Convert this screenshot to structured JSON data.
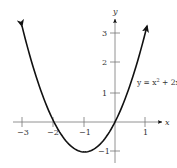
{
  "chart_data": {
    "type": "line",
    "title": "",
    "function": "y = x^2 + 2x",
    "annotation": "y = x² + 2x",
    "xlabel": "x",
    "ylabel": "y",
    "xlim": [
      -3.3,
      1.5
    ],
    "ylim": [
      -1.4,
      3.4
    ],
    "xticks": [
      -3,
      -2,
      -1,
      1
    ],
    "xtick_labels": [
      "−3",
      "−2",
      "−1",
      "1"
    ],
    "yticks": [
      -1,
      1,
      2,
      3
    ],
    "ytick_labels": [
      "−1",
      "1",
      "2",
      "3"
    ],
    "grid": false,
    "series": [
      {
        "name": "y = x^2 + 2x",
        "x": [
          -3.05,
          -3,
          -2.5,
          -2,
          -1.5,
          -1,
          -0.5,
          0,
          0.5,
          1,
          1.05
        ],
        "y": [
          3.2,
          3,
          1.25,
          0,
          -0.75,
          -1,
          -0.75,
          0,
          1.25,
          3,
          3.2
        ],
        "color": "#111111"
      }
    ],
    "key_points": {
      "vertex": [
        -1,
        -1
      ],
      "x_intercepts": [
        [
          -2,
          0
        ],
        [
          0,
          0
        ]
      ]
    },
    "arrows_on_ends": true
  },
  "labels": {
    "x_axis": "x",
    "y_axis": "y",
    "equation_prefix": "y = x",
    "equation_exp": "2",
    "equation_suffix": " + 2x",
    "tick_x_m3": "−3",
    "tick_x_m2": "−2",
    "tick_x_m1": "−1",
    "tick_x_1": "1",
    "tick_y_m1": "−1",
    "tick_y_1": "1",
    "tick_y_2": "2",
    "tick_y_3": "3"
  }
}
